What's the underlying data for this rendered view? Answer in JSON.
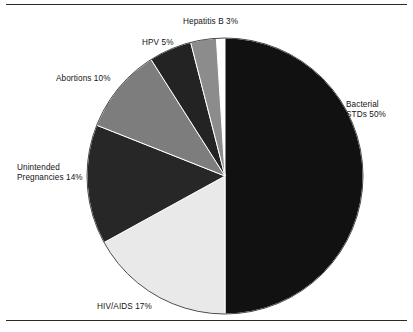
{
  "figure": {
    "background_color": "#ffffff",
    "rule_color": "#2b2b2b",
    "top_rule": true,
    "bottom_rule": true
  },
  "chart_data": {
    "type": "pie",
    "title": "",
    "subtitle": "",
    "xlabel": "",
    "ylabel": "",
    "legend_position": "none",
    "label_format": "{name} {value}%",
    "start_angle_deg": 0,
    "direction": "clockwise",
    "center": {
      "x": 225,
      "y": 176
    },
    "radius": 138,
    "categories": [
      "Bacterial STDs",
      "HIV/AIDS",
      "Unintended Pregnancies",
      "Abortions",
      "HPV",
      "Hepatitis B"
    ],
    "values": [
      50,
      17,
      14,
      10,
      5,
      3
    ],
    "colors": [
      "#111111",
      "#e9e9e9",
      "#272727",
      "#7d7d7d",
      "#232323",
      "#8c8c8c"
    ],
    "slices": [
      {
        "name": "Bacterial STDs",
        "value": 50,
        "value_text": "50%",
        "label": "Bacterial\nSTDs 50%",
        "color": "#111111",
        "start_deg": 0,
        "end_deg": 180
      },
      {
        "name": "HIV/AIDS",
        "value": 17,
        "value_text": "17%",
        "label": "HIV/AIDS 17%",
        "color": "#e9e9e9",
        "start_deg": 180,
        "end_deg": 241.2
      },
      {
        "name": "Unintended Pregnancies",
        "value": 14,
        "value_text": "14%",
        "label": "Unintended\nPregnancies 14%",
        "color": "#272727",
        "start_deg": 241.2,
        "end_deg": 291.6
      },
      {
        "name": "Abortions",
        "value": 10,
        "value_text": "10%",
        "label": "Abortions 10%",
        "color": "#7d7d7d",
        "start_deg": 291.6,
        "end_deg": 327.6
      },
      {
        "name": "HPV",
        "value": 5,
        "value_text": "5%",
        "label": "HPV 5%",
        "color": "#232323",
        "start_deg": 327.6,
        "end_deg": 345.6
      },
      {
        "name": "Hepatitis B",
        "value": 3,
        "value_text": "3%",
        "label": "Hepatitis B 3%",
        "color": "#8c8c8c",
        "start_deg": 345.6,
        "end_deg": 356.4
      }
    ]
  }
}
